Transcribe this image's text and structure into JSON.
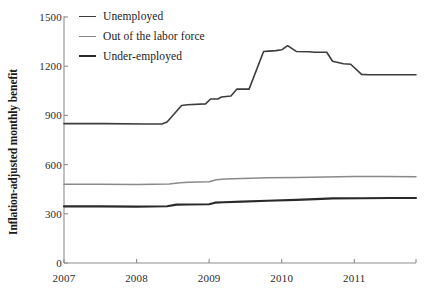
{
  "chart_data": {
    "type": "line",
    "title": "",
    "xlabel": "",
    "ylabel": "Inflation-adjusted monthly benefit",
    "xlim": [
      2007.0,
      2011.85
    ],
    "ylim": [
      0,
      1500
    ],
    "grid": false,
    "legend_position": "top-left inside plot",
    "x_tick_labels": [
      "2007",
      "2008",
      "2009",
      "2010",
      "2011"
    ],
    "x_ticks": [
      2007,
      2008,
      2009,
      2010,
      2011
    ],
    "y_tick_labels": [
      "0",
      "300",
      "600",
      "900",
      "1200",
      "1500"
    ],
    "y_ticks": [
      0,
      300,
      600,
      900,
      1200,
      1500
    ],
    "series": [
      {
        "name": "Unemployed",
        "color": "#3d3d3d",
        "width": 1.6,
        "x": [
          2007.0,
          2007.55,
          2008.1,
          2008.35,
          2008.42,
          2008.62,
          2008.7,
          2008.95,
          2009.02,
          2009.12,
          2009.17,
          2009.3,
          2009.38,
          2009.55,
          2009.75,
          2009.82,
          2009.92,
          2010.0,
          2010.08,
          2010.2,
          2010.38,
          2010.45,
          2010.62,
          2010.7,
          2010.85,
          2010.95,
          2011.1,
          2011.2,
          2011.85
        ],
        "y": [
          850,
          850,
          848,
          848,
          860,
          960,
          965,
          970,
          1000,
          1000,
          1012,
          1018,
          1060,
          1060,
          1290,
          1292,
          1295,
          1300,
          1325,
          1290,
          1288,
          1285,
          1285,
          1230,
          1215,
          1212,
          1150,
          1148,
          1148
        ]
      },
      {
        "name": "Out of the labor force",
        "color": "#8a8a8a",
        "width": 1.5,
        "x": [
          2007.0,
          2007.5,
          2008.0,
          2008.45,
          2008.6,
          2008.72,
          2009.0,
          2009.1,
          2009.22,
          2009.45,
          2009.8,
          2010.2,
          2010.6,
          2011.0,
          2011.4,
          2011.85
        ],
        "y": [
          480,
          480,
          478,
          482,
          490,
          492,
          496,
          508,
          512,
          516,
          520,
          522,
          525,
          527,
          527,
          526
        ]
      },
      {
        "name": "Under-employed",
        "color": "#2a2a2a",
        "width": 2.1,
        "x": [
          2007.0,
          2007.5,
          2008.0,
          2008.42,
          2008.55,
          2008.7,
          2009.0,
          2009.08,
          2009.2,
          2009.45,
          2009.8,
          2010.2,
          2010.55,
          2010.7,
          2011.1,
          2011.5,
          2011.85
        ],
        "y": [
          345,
          345,
          344,
          346,
          356,
          357,
          358,
          368,
          370,
          374,
          380,
          385,
          391,
          394,
          395,
          396,
          396
        ]
      }
    ]
  },
  "legend": {
    "items": [
      {
        "label": "Unemployed",
        "color": "#3d3d3d",
        "thickness": "1.6px"
      },
      {
        "label": "Out of the labor force",
        "color": "#8a8a8a",
        "thickness": "1.5px"
      },
      {
        "label": "Under-employed",
        "color": "#2a2a2a",
        "thickness": "2.4px"
      }
    ]
  },
  "axes": {
    "y_title": "Inflation-adjusted monthly benefit",
    "axis_color": "#8d8d8d"
  }
}
